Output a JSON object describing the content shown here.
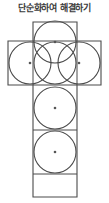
{
  "page": {
    "title": "단순화하여 해결하기",
    "background_color": "#ffffff",
    "title_color": "#3b3b3b"
  },
  "figure": {
    "name": "cross-of-squares-with-inscribed-circles",
    "stroke_color": "#4a4a4a",
    "dot_color": "#555555",
    "cell_size": 44,
    "square_count": 6,
    "circle_count": 6,
    "dot_count": 6,
    "outline_points": "33,22 77,22 77,41 101,41 101,85 77,85 77,197 33,197 33,85 8,85 8,41 33,41",
    "cells": [
      {
        "id": "cell-top",
        "cx": 55,
        "cy": 42,
        "r": 21
      },
      {
        "id": "cell-left",
        "cx": 30,
        "cy": 63,
        "r": 21
      },
      {
        "id": "cell-center",
        "cx": 55,
        "cy": 63,
        "r": 21
      },
      {
        "id": "cell-right",
        "cx": 79,
        "cy": 63,
        "r": 21
      },
      {
        "id": "cell-lower-middle",
        "cx": 55,
        "cy": 108,
        "r": 21
      },
      {
        "id": "cell-bottom",
        "cx": 55,
        "cy": 152,
        "r": 21
      }
    ],
    "grid_lines": [
      {
        "id": "line-top-square-bottom",
        "x1": 33,
        "y1": 41,
        "x2": 77,
        "y2": 41
      },
      {
        "id": "line-row-bottom",
        "x1": 33,
        "y1": 85,
        "x2": 77,
        "y2": 85
      },
      {
        "id": "line-column-divider-1",
        "x1": 33,
        "y1": 130,
        "x2": 77,
        "y2": 130
      },
      {
        "id": "line-column-divider-2",
        "x1": 33,
        "y1": 174,
        "x2": 77,
        "y2": 174
      }
    ]
  }
}
